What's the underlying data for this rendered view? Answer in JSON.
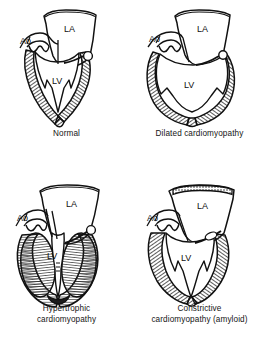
{
  "figure": {
    "background_color": "#ffffff",
    "ink_color": "#111111",
    "hatch_color": "#2a2a2a",
    "panel_count": 4
  },
  "labels": {
    "aorta": "Ao",
    "left_atrium": "LA",
    "left_ventricle": "LV"
  },
  "panels": [
    {
      "id": "normal",
      "caption": "Normal",
      "position": "top-left",
      "labels": [
        "Ao",
        "LA",
        "LV"
      ],
      "wall": "normal thickness, hatched myocardium",
      "cavity": "conical, apex pointed"
    },
    {
      "id": "dilated",
      "caption": "Dilated cardiomyopathy",
      "position": "top-right",
      "labels": [
        "Ao",
        "LA",
        "LV"
      ],
      "wall": "thinned, hatched myocardium",
      "cavity": "globular, enlarged"
    },
    {
      "id": "hypertrophic",
      "caption": "Hypertrophic\ncardiomyopathy",
      "position": "bottom-left",
      "labels": [
        "Ao",
        "LA",
        "LV"
      ],
      "wall": "markedly thickened, densely hatched myocardium",
      "cavity": "narrow slit-like"
    },
    {
      "id": "constrictive",
      "caption": "Constrictive\ncardiomyopathy (amyloid)",
      "position": "bottom-right",
      "labels": [
        "Ao",
        "LA",
        "LV"
      ],
      "wall": "thickened with stippled pericardial roof",
      "cavity": "small, rigid"
    }
  ]
}
